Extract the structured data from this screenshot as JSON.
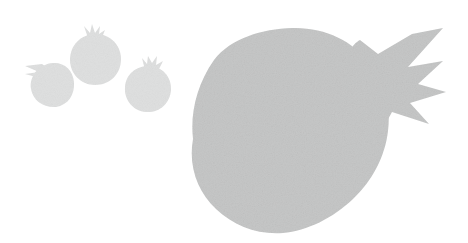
{
  "artwork": {
    "title": "Pomegranate Silhouettes",
    "subject": "pomegranate",
    "style": "flat grayscale silhouette",
    "background_color": "#ffffff",
    "canvas_width": 468,
    "canvas_height": 243,
    "object_count": 4,
    "texture": "subtle paper grain noise"
  },
  "palette": {
    "background": "#ffffff",
    "large_fruit_fill": "#c6c7c7",
    "small_fruit_fill": "#dfe0e0",
    "noise_overlay": "#b8b9b9"
  },
  "objects": [
    {
      "id": "large-pomegranate",
      "label": "Large pomegranate",
      "fill": "#c6c7c7",
      "body": {
        "center_x": 290,
        "center_y": 131,
        "radius_x": 98,
        "radius_y": 103
      },
      "crown": {
        "label": "Calyx crown",
        "direction": "right",
        "spike_count": 4,
        "tip_x": 443,
        "tip_y": 64
      }
    },
    {
      "id": "small-pomegranate-left",
      "label": "Small pomegranate (left)",
      "fill": "#dfe0e0",
      "body": {
        "center_x": 51,
        "center_y": 84,
        "radius_x": 22,
        "radius_y": 22
      },
      "crown": {
        "label": "Calyx crown",
        "direction": "upper-left",
        "spike_count": 3,
        "tip_x": 25,
        "tip_y": 66
      }
    },
    {
      "id": "small-pomegranate-top",
      "label": "Small pomegranate (top)",
      "fill": "#dfe0e0",
      "body": {
        "center_x": 95,
        "center_y": 59,
        "radius_x": 26,
        "radius_y": 26
      },
      "crown": {
        "label": "Calyx crown",
        "direction": "up",
        "spike_count": 4,
        "tip_x": 92,
        "tip_y": 24
      }
    },
    {
      "id": "small-pomegranate-right",
      "label": "Small pomegranate (right)",
      "fill": "#dfe0e0",
      "body": {
        "center_x": 148,
        "center_y": 89,
        "radius_x": 23,
        "radius_y": 23
      },
      "crown": {
        "label": "Calyx crown",
        "direction": "upper-right",
        "spike_count": 4,
        "tip_x": 157,
        "tip_y": 56
      }
    }
  ]
}
